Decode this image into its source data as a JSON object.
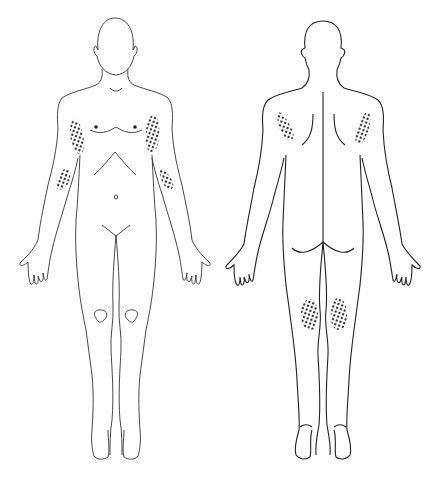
{
  "figure": {
    "views": [
      {
        "id": "anterior",
        "label": "Front view"
      },
      {
        "id": "posterior",
        "label": "Back view"
      }
    ],
    "marked_regions": [
      {
        "view": "anterior",
        "region": "right upper arm (inner)"
      },
      {
        "view": "anterior",
        "region": "left upper arm (inner)"
      },
      {
        "view": "anterior",
        "region": "right forearm"
      },
      {
        "view": "anterior",
        "region": "left forearm"
      },
      {
        "view": "posterior",
        "region": "right upper arm (back)"
      },
      {
        "view": "posterior",
        "region": "left upper arm (back)"
      },
      {
        "view": "posterior",
        "region": "right back of knee"
      },
      {
        "view": "posterior",
        "region": "left back of knee"
      }
    ],
    "colors": {
      "line": "#333333",
      "dots": "#222222",
      "background": "#ffffff"
    }
  },
  "caption": ""
}
